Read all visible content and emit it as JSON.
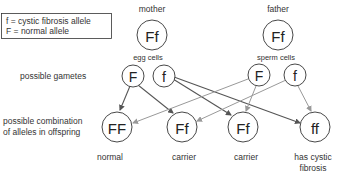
{
  "legend": {
    "line1": "f = cystic fibrosis allele",
    "line2": "F = normal allele"
  },
  "parents": {
    "mother": {
      "label": "mother",
      "genotype": "Ff",
      "gamete_label": "egg cells"
    },
    "father": {
      "label": "father",
      "genotype": "Ff",
      "gamete_label": "sperm cells"
    }
  },
  "row_labels": {
    "gametes": "possible gametes",
    "offspring_line1": "possible combination",
    "offspring_line2": "of alleles in offspring"
  },
  "gametes": {
    "egg": [
      "F",
      "f"
    ],
    "sperm": [
      "F",
      "f"
    ]
  },
  "offspring": [
    {
      "genotype": "FF",
      "label_line1": "normal",
      "label_line2": ""
    },
    {
      "genotype": "Ff",
      "label_line1": "carrier",
      "label_line2": ""
    },
    {
      "genotype": "Ff",
      "label_line1": "carrier",
      "label_line2": ""
    },
    {
      "genotype": "ff",
      "label_line1": "has cystic",
      "label_line2": "fibrosis"
    }
  ],
  "colors": {
    "egg_arrow": "#555555",
    "sperm_arrow": "#999999"
  }
}
